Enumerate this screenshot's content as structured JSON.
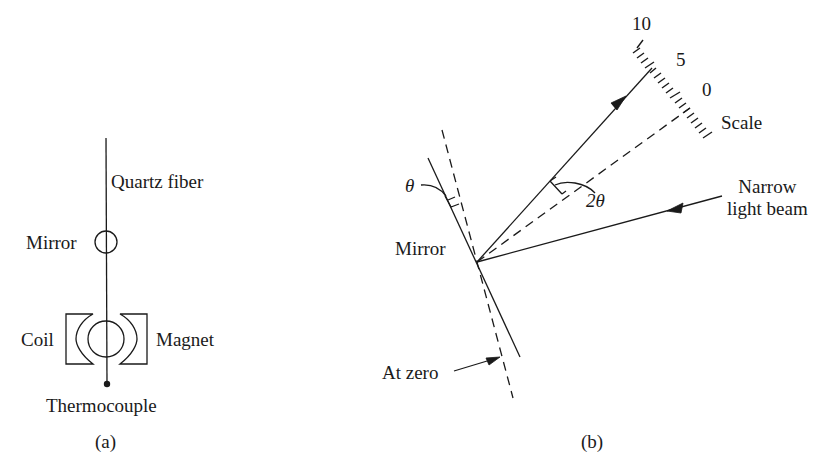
{
  "panel_a": {
    "caption": "(a)",
    "labels": {
      "quartz_fiber": "Quartz fiber",
      "mirror": "Mirror",
      "coil": "Coil",
      "magnet": "Magnet",
      "thermocouple": "Thermocouple"
    }
  },
  "panel_b": {
    "caption": "(b)",
    "labels": {
      "theta": "θ",
      "two_theta": "2θ",
      "mirror": "Mirror",
      "at_zero": "At zero",
      "narrow_light_beam_line1": "Narrow",
      "narrow_light_beam_line2": "light beam",
      "scale": "Scale"
    },
    "scale_ticks": {
      "ten": "10",
      "five": "5",
      "zero": "0"
    }
  },
  "colors": {
    "ink": "#1a1a1a",
    "background": "#ffffff"
  }
}
